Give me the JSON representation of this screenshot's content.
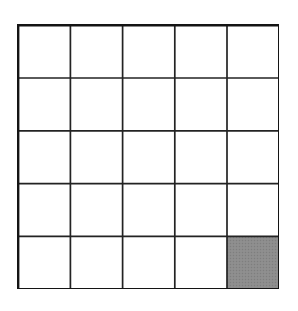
{
  "figure": {
    "type": "grid-diagram",
    "background_color": "#ffffff"
  },
  "grid": {
    "rows": 5,
    "columns": 5,
    "total_cells": 25,
    "shaded_cells": 1,
    "unshaded_cells": 24,
    "origin_x": 18,
    "origin_y": 25,
    "width": 261,
    "height": 264,
    "cell_width": 52.2,
    "cell_height": 52.8,
    "outer_border_color": "#141414",
    "outer_border_width": 2.4,
    "inner_line_color": "#232323",
    "inner_line_width": 1.7,
    "cell_fill_color": "#ffffff",
    "shaded_fill_color": "#8c8c8c",
    "shaded_texture": "halftone-dots"
  },
  "cells": [
    {
      "row": 1,
      "col": 1,
      "shaded": false
    },
    {
      "row": 1,
      "col": 2,
      "shaded": false
    },
    {
      "row": 1,
      "col": 3,
      "shaded": false
    },
    {
      "row": 1,
      "col": 4,
      "shaded": false
    },
    {
      "row": 1,
      "col": 5,
      "shaded": false
    },
    {
      "row": 2,
      "col": 1,
      "shaded": false
    },
    {
      "row": 2,
      "col": 2,
      "shaded": false
    },
    {
      "row": 2,
      "col": 3,
      "shaded": false
    },
    {
      "row": 2,
      "col": 4,
      "shaded": false
    },
    {
      "row": 2,
      "col": 5,
      "shaded": false
    },
    {
      "row": 3,
      "col": 1,
      "shaded": false
    },
    {
      "row": 3,
      "col": 2,
      "shaded": false
    },
    {
      "row": 3,
      "col": 3,
      "shaded": false
    },
    {
      "row": 3,
      "col": 4,
      "shaded": false
    },
    {
      "row": 3,
      "col": 5,
      "shaded": false
    },
    {
      "row": 4,
      "col": 1,
      "shaded": false
    },
    {
      "row": 4,
      "col": 2,
      "shaded": false
    },
    {
      "row": 4,
      "col": 3,
      "shaded": false
    },
    {
      "row": 4,
      "col": 4,
      "shaded": false
    },
    {
      "row": 4,
      "col": 5,
      "shaded": false
    },
    {
      "row": 5,
      "col": 1,
      "shaded": false
    },
    {
      "row": 5,
      "col": 2,
      "shaded": false
    },
    {
      "row": 5,
      "col": 3,
      "shaded": false
    },
    {
      "row": 5,
      "col": 4,
      "shaded": false
    },
    {
      "row": 5,
      "col": 5,
      "shaded": true
    }
  ]
}
